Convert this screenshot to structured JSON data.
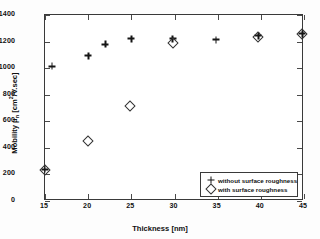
{
  "chart_data": {
    "type": "scatter",
    "title": "",
    "xlabel": "Thickness [nm]",
    "ylabel": "Mobility μₙ [cm²/V.sec]",
    "xlim": [
      15,
      45
    ],
    "ylim": [
      0,
      1400
    ],
    "xticks": [
      15,
      20,
      25,
      30,
      35,
      40,
      45
    ],
    "yticks": [
      0,
      200,
      400,
      600,
      800,
      1000,
      1200,
      1400
    ],
    "grid": false,
    "legend_position": "lower right",
    "series": [
      {
        "name": "without surface roughness",
        "marker": "plus",
        "points": [
          {
            "x": 15.0,
            "y": 240
          },
          {
            "x": 15.8,
            "y": 1015
          },
          {
            "x": 20.0,
            "y": 1095
          },
          {
            "x": 22.0,
            "y": 1180
          },
          {
            "x": 25.0,
            "y": 1222
          },
          {
            "x": 29.8,
            "y": 1222
          },
          {
            "x": 34.8,
            "y": 1215
          },
          {
            "x": 39.7,
            "y": 1245
          },
          {
            "x": 44.8,
            "y": 1258
          }
        ]
      },
      {
        "name": "with surface roughness",
        "marker": "diamond",
        "points": [
          {
            "x": 15.0,
            "y": 232
          },
          {
            "x": 20.0,
            "y": 450
          },
          {
            "x": 24.8,
            "y": 715
          },
          {
            "x": 29.8,
            "y": 1190
          },
          {
            "x": 39.7,
            "y": 1238
          },
          {
            "x": 44.8,
            "y": 1255
          }
        ]
      }
    ]
  },
  "axes": {
    "x_tick_labels": [
      "15",
      "20",
      "25",
      "30",
      "35",
      "40",
      "45"
    ],
    "y_tick_labels": [
      "0",
      "200",
      "400",
      "600",
      "800",
      "1000",
      "1200",
      "1400"
    ],
    "x_axis_title": "Thickness [nm]",
    "y_axis_title_prefix": "Mobility ",
    "y_axis_title_symbol": "μ",
    "y_axis_title_sub": "n",
    "y_axis_title_unit_a": " [cm",
    "y_axis_title_sup": "2",
    "y_axis_title_unit_b": "/V.sec]"
  },
  "legend": {
    "entries": [
      {
        "label": "without surface roughness",
        "marker": "plus"
      },
      {
        "label": "with surface roughness",
        "marker": "diamond"
      }
    ]
  }
}
